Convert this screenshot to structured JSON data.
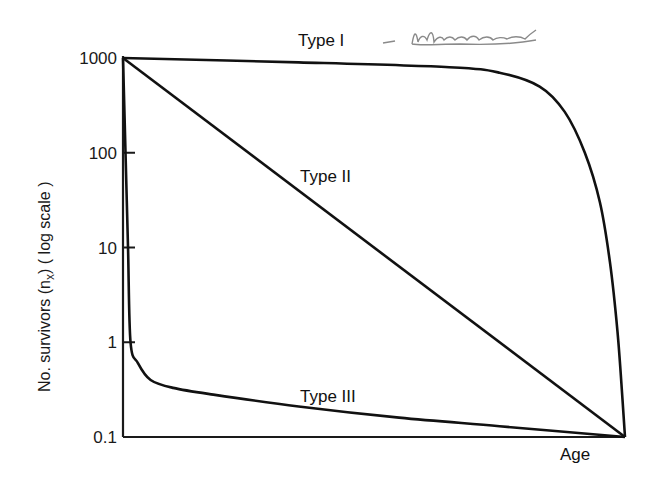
{
  "chart_data": {
    "type": "line",
    "title": "",
    "xlabel": "Age",
    "ylabel": "No. survivors (n",
    "ylabel_subscript": "x",
    "ylabel_suffix": ") ( log scale )",
    "yscale": "log",
    "ylim": [
      0.1,
      1000
    ],
    "xlim": [
      0,
      1
    ],
    "y_ticks": [
      1000,
      100,
      10,
      1,
      0.1
    ],
    "y_tick_labels": [
      "1000",
      "100",
      "10",
      "1",
      "0.1"
    ],
    "x_ticks": [],
    "grid": false,
    "legend": "none (curves labeled inline)",
    "annotations": [
      {
        "text": "Type I",
        "series": "Type I"
      },
      {
        "text": "- (handwritten note, illegible)",
        "series": "Type I"
      },
      {
        "text": "Type II",
        "series": "Type II"
      },
      {
        "text": "Type III",
        "series": "Type III"
      }
    ],
    "series": [
      {
        "name": "Type I",
        "label": "Type I",
        "x": [
          0,
          0.35,
          0.65,
          0.75,
          0.83,
          0.88,
          0.92,
          0.95,
          0.97,
          0.985,
          0.995,
          1.0
        ],
        "y": [
          1000,
          900,
          800,
          700,
          500,
          270,
          100,
          30,
          7,
          1.3,
          0.25,
          0.1
        ]
      },
      {
        "name": "Type II",
        "label": "Type II",
        "x": [
          0,
          1.0
        ],
        "y": [
          1000,
          0.1
        ]
      },
      {
        "name": "Type III",
        "label": "Type III",
        "x": [
          0,
          0.005,
          0.01,
          0.015,
          0.03,
          0.055,
          0.1,
          0.18,
          0.35,
          0.55,
          0.75,
          1.0
        ],
        "y": [
          1000,
          100,
          10,
          1,
          0.6,
          0.4,
          0.33,
          0.28,
          0.21,
          0.16,
          0.13,
          0.1
        ]
      }
    ],
    "handwritten_note": "- (illegible scribble)"
  },
  "colors": {
    "line": "#111111",
    "axis": "#1a1a1a",
    "handwriting": "#8a8a8a",
    "background": "#ffffff"
  }
}
